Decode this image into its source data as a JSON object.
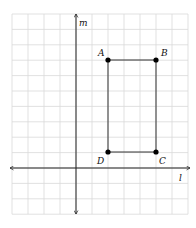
{
  "figure": {
    "type": "coordinate-grid-diagram",
    "grid": {
      "x_lines": [
        12,
        28,
        44,
        60,
        76,
        92,
        108,
        124,
        140,
        156,
        172,
        188
      ],
      "y_lines": [
        14,
        29.4,
        44.8,
        60.2,
        75.6,
        91,
        106.4,
        121.8,
        137.2,
        152.6,
        168,
        183.4,
        198.8,
        214.2
      ],
      "color": "#d9d9d9"
    },
    "axes": {
      "horizontal": {
        "label": "l",
        "y": 168,
        "x_start": 10,
        "x_end": 190
      },
      "vertical": {
        "label": "m",
        "x": 76,
        "y_start": 14,
        "y_end": 214
      }
    },
    "rectangle": {
      "vertices": [
        {
          "name": "A",
          "x": 108,
          "y": 60,
          "label_dx": -10,
          "label_dy": -4
        },
        {
          "name": "B",
          "x": 156,
          "y": 60,
          "label_dx": 5,
          "label_dy": -4
        },
        {
          "name": "C",
          "x": 156,
          "y": 152,
          "label_dx": 3,
          "label_dy": 12
        },
        {
          "name": "D",
          "x": 108,
          "y": 152,
          "label_dx": -11,
          "label_dy": 12
        }
      ],
      "grid_coords": {
        "A": [
          2,
          7
        ],
        "B": [
          5,
          7
        ],
        "C": [
          5,
          1
        ],
        "D": [
          2,
          1
        ]
      }
    }
  }
}
